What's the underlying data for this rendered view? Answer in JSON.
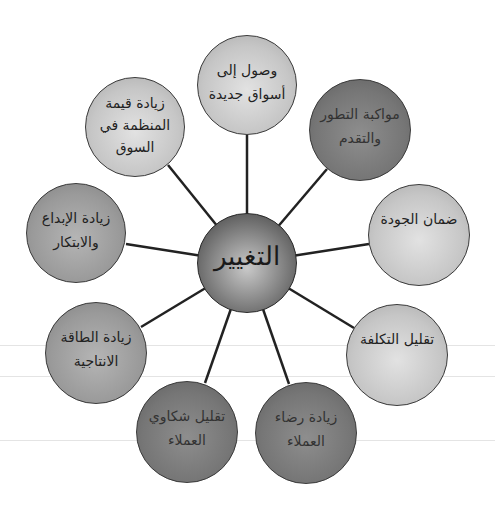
{
  "diagram": {
    "type": "radial-hub",
    "center": {
      "label": "التغيير",
      "x": 247,
      "y": 263,
      "r": 50
    },
    "nodes": [
      {
        "id": "top",
        "label": "وصول إلى\nأسواق جديدة",
        "x": 247,
        "y": 85,
        "r": 50,
        "shade": "light"
      },
      {
        "id": "top-right",
        "label": "مواكبة التطور\nوالتقدم",
        "x": 360,
        "y": 130,
        "r": 51,
        "shade": "dark"
      },
      {
        "id": "right",
        "label": "ضمان الجودة",
        "x": 419,
        "y": 235,
        "r": 51,
        "shade": "light"
      },
      {
        "id": "right-bottom",
        "label": "تقليل التكلفة",
        "x": 397,
        "y": 355,
        "r": 51,
        "shade": "light"
      },
      {
        "id": "bottom-right",
        "label": "زيادة رضاء\nالعملاء",
        "x": 306,
        "y": 433,
        "r": 51,
        "shade": "dark"
      },
      {
        "id": "bottom-left",
        "label": "تقليل شكاوي\nالعملاء",
        "x": 187,
        "y": 432,
        "r": 51,
        "shade": "dark"
      },
      {
        "id": "left-bottom",
        "label": "زيادة الطاقة\nالانتاجية",
        "x": 96,
        "y": 353,
        "r": 51,
        "shade": "medium"
      },
      {
        "id": "left",
        "label": "زيادة الإبداع\nوالابتكار",
        "x": 76,
        "y": 233,
        "r": 50,
        "shade": "medium"
      },
      {
        "id": "top-left",
        "label": "زيادة قيمة\nالمنظمة في\nالسوق",
        "x": 135,
        "y": 127,
        "r": 50,
        "shade": "light"
      }
    ],
    "colors": {
      "light": "#c6c6c6",
      "medium": "#9a9a9a",
      "dark": "#767676",
      "hub": "#6a6a6a",
      "connector": "#222222"
    }
  }
}
